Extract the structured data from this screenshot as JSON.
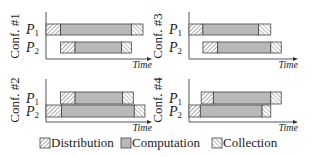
{
  "axis_label": "Time",
  "legend": [
    {
      "key": "distribution",
      "label": "Distribution"
    },
    {
      "key": "computation",
      "label": "Computation"
    },
    {
      "key": "collection",
      "label": "Collection"
    }
  ],
  "colors": {
    "computation": "#b9b9b9",
    "hatch_bg": "#ffffff",
    "distribution_hatch": "#555555",
    "collection_hatch": "#777777",
    "outline": "#444444"
  },
  "panels": [
    {
      "id": "conf1",
      "title": "Conf. #1",
      "rows": [
        {
          "label": "P",
          "sub": "1",
          "start": 0.0,
          "dist_end": 0.15,
          "comp_end": 0.88,
          "end": 1.0
        },
        {
          "label": "P",
          "sub": "2",
          "start": 0.15,
          "dist_end": 0.3,
          "comp_end": 0.78,
          "end": 0.88
        }
      ]
    },
    {
      "id": "conf3",
      "title": "Conf. #3",
      "rows": [
        {
          "label": "P",
          "sub": "1",
          "start": 0.0,
          "dist_end": 0.16,
          "comp_end": 0.8,
          "end": 0.94
        },
        {
          "label": "P",
          "sub": "2",
          "start": 0.16,
          "dist_end": 0.33,
          "comp_end": 0.94,
          "end": 1.06
        }
      ]
    },
    {
      "id": "conf2",
      "title": "Conf. #2",
      "rows": [
        {
          "label": "P",
          "sub": "1",
          "start": 0.15,
          "dist_end": 0.3,
          "comp_end": 0.79,
          "end": 0.9
        },
        {
          "label": "P",
          "sub": "2",
          "start": 0.0,
          "dist_end": 0.16,
          "comp_end": 0.91,
          "end": 1.02
        }
      ]
    },
    {
      "id": "conf4",
      "title": "Conf. #4",
      "rows": [
        {
          "label": "P",
          "sub": "1",
          "start": 0.14,
          "dist_end": 0.28,
          "comp_end": 0.94,
          "end": 1.06
        },
        {
          "label": "P",
          "sub": "2",
          "start": 0.0,
          "dist_end": 0.13,
          "comp_end": 0.84,
          "end": 0.94
        }
      ]
    }
  ]
}
